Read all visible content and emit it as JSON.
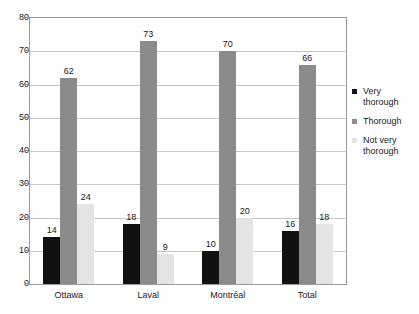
{
  "chart_data": {
    "type": "bar",
    "title": "",
    "subtitle": "",
    "xlabel": "",
    "ylabel": "",
    "ylim": [
      0,
      80
    ],
    "ytick_step": 10,
    "yticks": [
      "80",
      "70",
      "60",
      "50",
      "40",
      "30",
      "20",
      "10",
      "0"
    ],
    "grid": true,
    "legend_position": "right",
    "categories": [
      "Ottawa",
      "Laval",
      "Montréal",
      "Total"
    ],
    "series": [
      {
        "name": "Very thorough",
        "color": "#111111",
        "values": [
          14,
          18,
          10,
          16
        ]
      },
      {
        "name": "Thorough",
        "color": "#8b8b8b",
        "values": [
          62,
          73,
          70,
          66
        ]
      },
      {
        "name": "Not very thorough",
        "color": "#e4e4e4",
        "values": [
          24,
          9,
          20,
          18
        ]
      }
    ],
    "data_labels": [
      [
        "14",
        "62",
        "24"
      ],
      [
        "18",
        "73",
        "9"
      ],
      [
        "10",
        "70",
        "20"
      ],
      [
        "16",
        "66",
        "18"
      ]
    ]
  },
  "legend": {
    "items": [
      {
        "line1": "Very",
        "line2": "thorough"
      },
      {
        "line1": "Thorough",
        "line2": ""
      },
      {
        "line1": "Not very",
        "line2": "thorough"
      }
    ]
  },
  "colors": {
    "series_very_thorough": "#111111",
    "series_thorough": "#8b8b8b",
    "series_not_very_thorough": "#e4e4e4",
    "gridline": "#c8c8c8",
    "frame": "#9a9a9a",
    "text": "#1a1a1a",
    "background": "#ffffff"
  },
  "residue": {
    "text": "."
  }
}
